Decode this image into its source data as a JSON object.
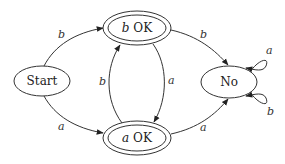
{
  "diagram": {
    "type": "finite-state-machine",
    "states": [
      {
        "id": "start",
        "label": "Start",
        "accepting": false
      },
      {
        "id": "bok",
        "label_symbol": "b",
        "label_text": " OK",
        "accepting": true
      },
      {
        "id": "aok",
        "label_symbol": "a",
        "label_text": " OK",
        "accepting": true
      },
      {
        "id": "no",
        "label": "No",
        "accepting": false
      }
    ],
    "transitions": [
      {
        "from": "start",
        "to": "bok",
        "label": "b"
      },
      {
        "from": "start",
        "to": "aok",
        "label": "a"
      },
      {
        "from": "aok",
        "to": "bok",
        "label": "b"
      },
      {
        "from": "bok",
        "to": "aok",
        "label": "a"
      },
      {
        "from": "bok",
        "to": "no",
        "label": "b"
      },
      {
        "from": "aok",
        "to": "no",
        "label": "a"
      },
      {
        "from": "no",
        "to": "no",
        "label": "a"
      },
      {
        "from": "no",
        "to": "no",
        "label": "b"
      }
    ],
    "colors": {
      "stroke": "#333333",
      "background": "#ffffff"
    }
  }
}
